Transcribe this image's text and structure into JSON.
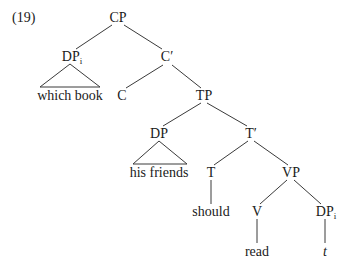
{
  "example_number": "(19)",
  "nodes": {
    "cp": "CP",
    "dp_wh": {
      "label": "DP",
      "index": "i"
    },
    "c_bar": "C′",
    "which_book": "which book",
    "c": "C",
    "tp": "TP",
    "dp_subj": "DP",
    "t_bar": "T′",
    "his_friends": "his friends",
    "t": "T",
    "vp": "VP",
    "should": "should",
    "v": "V",
    "dp_trace": {
      "label": "DP",
      "index": "i"
    },
    "read": "read",
    "trace": "t"
  },
  "colors": {
    "line": "#3a3a3a",
    "text": "#1a1a1a"
  }
}
